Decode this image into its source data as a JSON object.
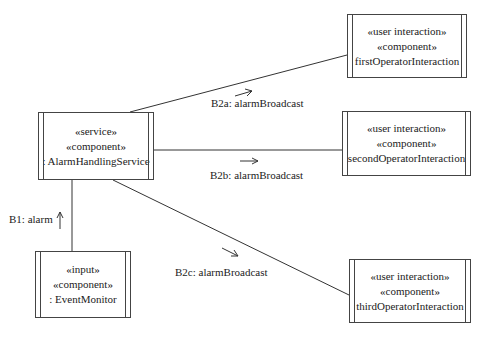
{
  "diagram": {
    "type": "UML communication diagram",
    "objects": {
      "alarm_handling_service": {
        "stereotype1": "«service»",
        "stereotype2": "«component»",
        "name": ": AlarmHandlingService"
      },
      "first_operator": {
        "stereotype1": "«user interaction»",
        "stereotype2": "«component»",
        "name": "firstOperatorInteraction"
      },
      "second_operator": {
        "stereotype1": "«user interaction»",
        "stereotype2": "«component»",
        "name": "secondOperatorInteraction"
      },
      "third_operator": {
        "stereotype1": "«user interaction»",
        "stereotype2": "«component»",
        "name": "thirdOperatorInteraction"
      },
      "event_monitor": {
        "stereotype1": "«input»",
        "stereotype2": "«component»",
        "name": ": EventMonitor"
      }
    },
    "messages": {
      "b1": "B1: alarm",
      "b2a": "B2a: alarmBroadcast",
      "b2b": "B2b: alarmBroadcast",
      "b2c": "B2c: alarmBroadcast"
    }
  }
}
